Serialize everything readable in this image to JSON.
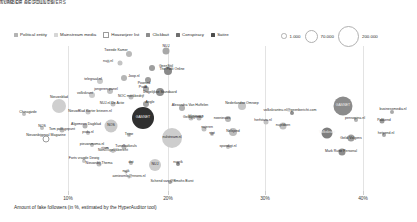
{
  "legends": {
    "type": {
      "title": "TYPE OF ACCOUNTS",
      "items": [
        {
          "label": "Political entity",
          "color": "#b3b3b3",
          "hollow": false
        },
        {
          "label": "Mainstream media",
          "color": "#d6d6d6",
          "hollow": false
        },
        {
          "label": "Hoaxwijzer list",
          "color": "#ffffff",
          "hollow": true
        },
        {
          "label": "Clickbait",
          "color": "#8c8c8c",
          "hollow": false
        },
        {
          "label": "Conspiracy",
          "color": "#6e6e6e",
          "hollow": false
        },
        {
          "label": "Satire",
          "color": "#4d4d4d",
          "hollow": false
        }
      ]
    },
    "size": {
      "title": "NUMBER OF FOLLOWERS",
      "items": [
        {
          "label": "1.000",
          "diameter": 3.5
        },
        {
          "label": "70.000",
          "diameter": 11
        },
        {
          "label": "200.000",
          "diameter": 19
        }
      ]
    }
  },
  "axis": {
    "caption": "Amount of fake followers (in %, estimated by the HyperAuditor tool)",
    "ticks": [
      {
        "label": "10%",
        "x": 68
      },
      {
        "label": "20%",
        "x": 168
      },
      {
        "label": "30%",
        "x": 265
      },
      {
        "label": "40%",
        "x": 363
      }
    ]
  },
  "chart_data": {
    "type": "scatter",
    "title": "",
    "xlabel": "Amount of fake followers (in %, estimated by the HyperAuditor tool)",
    "ylabel": "",
    "xlim": [
      5,
      45
    ],
    "size_encodes": "number of followers",
    "color_encodes": "type of account",
    "grid": "vertical only",
    "legend_position": "top",
    "points": [
      {
        "label": "Tweede Kamer",
        "x": 129,
        "y": 8,
        "d": 6,
        "color": "#b9b9b9",
        "lx": 116,
        "ly": 5
      },
      {
        "label": "NUJ",
        "x": 166,
        "y": 5,
        "d": 7,
        "color": "#a8a8a8",
        "lx": 166,
        "ly": 1
      },
      {
        "label": "nujij.nl",
        "x": 120,
        "y": 17,
        "d": 5,
        "color": "#c4c4c4",
        "lx": 108,
        "ly": 16
      },
      {
        "label": "GeenStijl",
        "x": 152,
        "y": 22,
        "d": 6,
        "color": "#9e9e9e",
        "lx": 166,
        "ly": 21
      },
      {
        "label": "The Post Online",
        "x": 168,
        "y": 25,
        "d": 8,
        "color": "#8a8a8a",
        "lx": 172,
        "ly": 24
      },
      {
        "label": "telegraaf.nl",
        "x": 100,
        "y": 35,
        "d": 6,
        "color": "#c9c9c9",
        "lx": 93,
        "ly": 34
      },
      {
        "label": "Joop.nl",
        "x": 124,
        "y": 32,
        "d": 6,
        "color": "#b5b5b5",
        "lx": 134,
        "ly": 31
      },
      {
        "label": "Powned",
        "x": 148,
        "y": 34,
        "d": 6,
        "color": "#9c9c9c",
        "lx": 144,
        "ly": 38
      },
      {
        "label": "jongeren-panel",
        "x": 110,
        "y": 45,
        "d": 6,
        "color": "#c0c0c0",
        "lx": 106,
        "ly": 44
      },
      {
        "label": "PvdA",
        "x": 146,
        "y": 43,
        "d": 6,
        "color": "#a6a6a6",
        "lx": 143,
        "ly": 42
      },
      {
        "label": "Dagelijkse Standaard",
        "x": 160,
        "y": 46,
        "d": 8,
        "color": "#8f8f8f",
        "lx": 160,
        "ly": 47
      },
      {
        "label": "volkskrant",
        "x": 92,
        "y": 49,
        "d": 6,
        "color": "#cccccc",
        "lx": 85,
        "ly": 48
      },
      {
        "label": "NOC merkbedrijf",
        "x": 131,
        "y": 51,
        "d": 5,
        "color": "#bdbdbd",
        "lx": 131,
        "ly": 51
      },
      {
        "label": "NUJ.nl De Actie",
        "x": 113,
        "y": 58,
        "d": 5,
        "color": "#c2c2c2",
        "lx": 112,
        "ly": 58
      },
      {
        "label": "Angle",
        "x": 146,
        "y": 58,
        "d": 6,
        "color": "#a3a3a3",
        "lx": 150,
        "ly": 57
      },
      {
        "label": "Nieuwsblad",
        "x": 59,
        "y": 60,
        "d": 14,
        "color": "#cfcfcf",
        "lx": 59,
        "ly": 52
      },
      {
        "label": "Alexandra Van Huffelen",
        "x": 182,
        "y": 62,
        "d": 6,
        "color": "#b0b0b0",
        "lx": 190,
        "ly": 60
      },
      {
        "label": "NieuwBlad Korter brieven.nl",
        "x": 88,
        "y": 66,
        "d": 5,
        "color": "#c6c6c6",
        "lx": 90,
        "ly": 66
      },
      {
        "label": "Chinagizde",
        "x": 24,
        "y": 68,
        "d": 4,
        "color": "#bdbdbd",
        "lx": 28,
        "ly": 67
      },
      {
        "label": "Nederlandse Omroep",
        "x": 242,
        "y": 60,
        "d": 8,
        "color": "#c6c6c6",
        "lx": 242,
        "ly": 58
      },
      {
        "label": "bbnieuws",
        "x": 199,
        "y": 72,
        "d": 5,
        "color": "#bababa",
        "lx": 196,
        "ly": 71
      },
      {
        "label": "Geldgigeraal",
        "x": 191,
        "y": 72,
        "d": 5,
        "color": "#c1c1c1",
        "lx": 193,
        "ly": 72
      },
      {
        "label": "nosnieuws",
        "x": 228,
        "y": 73,
        "d": 6,
        "color": "#b6b6b6",
        "lx": 222,
        "ly": 73
      },
      {
        "label": "GASNET",
        "x": 143,
        "y": 72,
        "d": 22,
        "color": "#2f2f2f",
        "lx": 143,
        "ly": 72,
        "inv": true
      },
      {
        "label": "NOS",
        "x": 111,
        "y": 80,
        "d": 13,
        "color": "#cacaca",
        "lx": 111,
        "ly": 80
      },
      {
        "label": "volkskrantnu.nl@geenbericht.com",
        "x": 292,
        "y": 67,
        "d": 4,
        "color": "#8e8e8e",
        "lx": 290,
        "ly": 65
      },
      {
        "label": "GASNET",
        "x": 343,
        "y": 60,
        "d": 19,
        "color": "#8b8b8b",
        "lx": 343,
        "ly": 60,
        "inv": true
      },
      {
        "label": "businessmedia.nl",
        "x": 392,
        "y": 66,
        "d": 4,
        "color": "#a9a9a9",
        "lx": 393,
        "ly": 64
      },
      {
        "label": "pensopina.nl",
        "x": 356,
        "y": 74,
        "d": 4,
        "color": "#b2b2b2",
        "lx": 355,
        "ly": 73
      },
      {
        "label": "Pakkend",
        "x": 382,
        "y": 75,
        "d": 5,
        "color": "#9b9b9b",
        "lx": 384,
        "ly": 75
      },
      {
        "label": "herfstara.nl",
        "x": 266,
        "y": 76,
        "d": 5,
        "color": "#c3c3c3",
        "lx": 263,
        "ly": 75
      },
      {
        "label": "nulstream.nl",
        "x": 172,
        "y": 92,
        "d": 20,
        "color": "#cdcdcd",
        "lx": 172,
        "ly": 92
      },
      {
        "label": "nujeren",
        "x": 204,
        "y": 83,
        "d": 5,
        "color": "#bfbfbf",
        "lx": 207,
        "ly": 82
      },
      {
        "label": "Nelsjond",
        "x": 233,
        "y": 86,
        "d": 8,
        "color": "#bcbcbc",
        "lx": 233,
        "ly": 86
      },
      {
        "label": "nujebben",
        "x": 283,
        "y": 80,
        "d": 7,
        "color": "#c0c0c0",
        "lx": 283,
        "ly": 80
      },
      {
        "label": "Volkskrant",
        "x": 327,
        "y": 87,
        "d": 11,
        "color": "#7e7e7e",
        "lx": 327,
        "ly": 87,
        "inv": true
      },
      {
        "label": "Geldi Volgens",
        "x": 351,
        "y": 92,
        "d": 7,
        "color": "#9d9d9d",
        "lx": 351,
        "ly": 93
      },
      {
        "label": "hetpend.nl",
        "x": 384,
        "y": 89,
        "d": 4,
        "color": "#a6a6a6",
        "lx": 386,
        "ly": 88
      },
      {
        "label": "NOS",
        "x": 42,
        "y": 82,
        "d": 4,
        "color": "#bfbfbf",
        "lx": 42,
        "ly": 81
      },
      {
        "label": "Tom polit-gepunt",
        "x": 62,
        "y": 84,
        "d": 5,
        "color": "#b8b8b8",
        "lx": 62,
        "ly": 84
      },
      {
        "label": "Algemeen Dagblad",
        "x": 85,
        "y": 80,
        "d": 5,
        "color": "#b2b2b2",
        "lx": 86,
        "ly": 79
      },
      {
        "label": "pvda.nl",
        "x": 88,
        "y": 87,
        "d": 4,
        "color": "#c3c3c3",
        "lx": 88,
        "ly": 87
      },
      {
        "label": "Trijne",
        "x": 129,
        "y": 89,
        "d": 4,
        "color": "#c8c8c8",
        "lx": 129,
        "ly": 89
      },
      {
        "label": "njpt",
        "x": 212,
        "y": 88,
        "d": 4,
        "color": "#c6c6c6",
        "lx": 212,
        "ly": 88
      },
      {
        "label": "Nieuwsbijgeval Magazine",
        "x": 46,
        "y": 93,
        "d": 5,
        "color": "#ffffff",
        "lx": 46,
        "ly": 90,
        "hollow": true
      },
      {
        "label": "pieuwsmoma.nl",
        "x": 92,
        "y": 99,
        "d": 4,
        "color": "#c0c0c0",
        "lx": 92,
        "ly": 99
      },
      {
        "label": "Tunelkatkeuls",
        "x": 124,
        "y": 101,
        "d": 5,
        "color": "#bbbbbb",
        "lx": 126,
        "ly": 101
      },
      {
        "label": "Nieuwsgelijkbericht",
        "x": 113,
        "y": 105,
        "d": 4,
        "color": "#c4c4c4",
        "lx": 113,
        "ly": 105
      },
      {
        "label": "rijom",
        "x": 107,
        "y": 103,
        "d": 4,
        "color": "#c9c9c9",
        "lx": 105,
        "ly": 103
      },
      {
        "label": "spondigt.nl",
        "x": 228,
        "y": 101,
        "d": 4,
        "color": "#c2c2c2",
        "lx": 228,
        "ly": 101
      },
      {
        "label": "Mark Rutte Personal",
        "x": 342,
        "y": 106,
        "d": 7,
        "color": "#8d8d8d",
        "lx": 341,
        "ly": 106
      },
      {
        "label": "Forts vragde Dewig",
        "x": 84,
        "y": 115,
        "d": 4,
        "color": "#c5c5c5",
        "lx": 84,
        "ly": 113
      },
      {
        "label": "Nieuwsbij Thema",
        "x": 99,
        "y": 118,
        "d": 5,
        "color": "#bdbdbd",
        "lx": 99,
        "ly": 118
      },
      {
        "label": "NUJ",
        "x": 155,
        "y": 119,
        "d": 12,
        "color": "#cccccc",
        "lx": 155,
        "ly": 119
      },
      {
        "label": "dot",
        "x": 131,
        "y": 117,
        "d": 4,
        "color": "#b9b9b9",
        "lx": 131,
        "ly": 117
      },
      {
        "label": "nugrik",
        "x": 178,
        "y": 118,
        "d": 4,
        "color": "#8f8f8f",
        "lx": 178,
        "ly": 117
      },
      {
        "label": "nujik",
        "x": 126,
        "y": 126,
        "d": 3,
        "color": "#c2c2c2",
        "lx": 126,
        "ly": 126
      },
      {
        "label": "aenieornle@nnons.nl",
        "x": 129,
        "y": 131,
        "d": 3,
        "color": "#c2c2c2",
        "lx": 129,
        "ly": 131
      },
      {
        "label": "Schend van @Bmohs Burst",
        "x": 170,
        "y": 136,
        "d": 4,
        "color": "#a5a5a5",
        "lx": 172,
        "ly": 136
      }
    ]
  }
}
